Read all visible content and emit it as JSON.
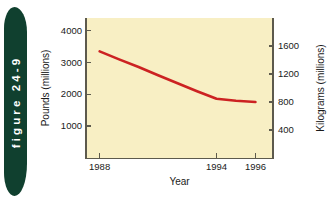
{
  "figure": {
    "tab_label": "figure 24-9",
    "tab_color": "#10402f",
    "tab_text_color": "#ffffff"
  },
  "chart_panel": {
    "background_color": "#f8efc4",
    "axis_color": "#5d5a4d",
    "line_color": "#cc2222"
  },
  "chart_data": {
    "type": "line",
    "title": "",
    "subtitle": "",
    "xlabel": "Year",
    "ylabel": "Pounds (millions)",
    "ylabel_secondary": "Kilograms (millions)",
    "x": [
      1988,
      1989,
      1990,
      1991,
      1992,
      1993,
      1994,
      1995,
      1996
    ],
    "xlim": [
      1987.3,
      1996.9
    ],
    "xtick_labels": [
      "1988",
      "1994",
      "1996"
    ],
    "xtick_values": [
      1988,
      1994,
      1996
    ],
    "ylim": [
      0,
      4400
    ],
    "ytick_labels": [
      "4000",
      "3000",
      "2000",
      "1000"
    ],
    "ytick_values": [
      4000,
      3000,
      2000,
      1000
    ],
    "ylim_secondary": [
      0,
      2000
    ],
    "ytick_labels_secondary": [
      "1600",
      "1200",
      "800",
      "400"
    ],
    "ytick_values_secondary": [
      1600,
      1200,
      800,
      400
    ],
    "grid": false,
    "legend": false,
    "legend_position": "none",
    "series": [
      {
        "name": "Pounds (millions)",
        "color": "#cc2222",
        "values": [
          3350,
          3100,
          2860,
          2600,
          2350,
          2100,
          1860,
          1800,
          1760
        ]
      }
    ],
    "annotations": []
  }
}
